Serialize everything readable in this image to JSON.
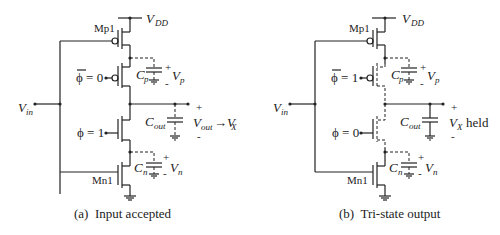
{
  "figure": {
    "panels": [
      {
        "id": "a",
        "caption": "(a)  Input accepted",
        "vdd_label": "V",
        "vdd_sub": "DD",
        "vin_label": "V",
        "vin_sub": "in",
        "mp1_label": "Mp1",
        "mn1_label": "Mn1",
        "phibar_label": "ϕ = 0",
        "phi_label": "ϕ = 1",
        "cp_label": "C",
        "cp_sub": "p",
        "vp_label": "V",
        "vp_sub": "p",
        "cout_label": "C",
        "cout_sub": "out",
        "out_label": "V",
        "out_sub": "out",
        "out_arrow": "→V",
        "out_arrow_sub": "X",
        "cn_label": "C",
        "cn_sub": "n",
        "vn_label": "V",
        "vn_sub": "n",
        "plus": "+",
        "minus": "-"
      },
      {
        "id": "b",
        "caption": "(b)  Tri-state output",
        "vdd_label": "V",
        "vdd_sub": "DD",
        "vin_label": "V",
        "vin_sub": "in",
        "mp1_label": "Mp1",
        "mn1_label": "Mn1",
        "phibar_label": "ϕ = 1",
        "phi_label": "ϕ = 0",
        "cp_label": "C",
        "cp_sub": "p",
        "vp_label": "V",
        "vp_sub": "p",
        "cout_label": "C",
        "cout_sub": "out",
        "out_label": "V",
        "out_sub": "X",
        "out_suffix": "held",
        "cn_label": "C",
        "cn_sub": "n",
        "vn_label": "V",
        "vn_sub": "n",
        "plus": "+",
        "minus": "-"
      }
    ]
  }
}
